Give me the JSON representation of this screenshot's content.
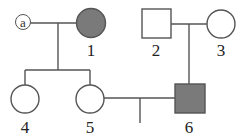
{
  "diagram": {
    "type": "pedigree",
    "colors": {
      "line": "#555555",
      "affected_fill": "#7a7a7a",
      "unaffected_fill": "#ffffff"
    },
    "individuals": [
      {
        "id": "a",
        "label": "a",
        "sex": "female",
        "affected": false,
        "note": "spouse marker"
      },
      {
        "id": "1",
        "label": "1",
        "sex": "female",
        "affected": true
      },
      {
        "id": "2",
        "label": "2",
        "sex": "male",
        "affected": false
      },
      {
        "id": "3",
        "label": "3",
        "sex": "female",
        "affected": false
      },
      {
        "id": "4",
        "label": "4",
        "sex": "female",
        "affected": false
      },
      {
        "id": "5",
        "label": "5",
        "sex": "female",
        "affected": false
      },
      {
        "id": "6",
        "label": "6",
        "sex": "male",
        "affected": true
      }
    ],
    "unions": [
      {
        "partners": [
          "a",
          "1"
        ],
        "children": [
          "4",
          "5"
        ]
      },
      {
        "partners": [
          "2",
          "3"
        ],
        "children": [
          "6"
        ]
      },
      {
        "partners": [
          "5",
          "6"
        ],
        "children": []
      }
    ]
  }
}
